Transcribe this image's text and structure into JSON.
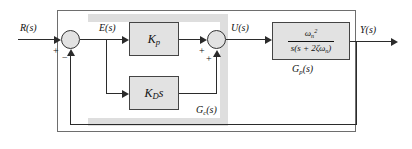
{
  "figure": {
    "frame_color": "#6e6e6e",
    "block_fill": "#e2e2e2",
    "band_color": "#dedede",
    "wire_color": "#2b2b2b"
  },
  "signals": {
    "input": "R(s)",
    "error": "E(s)",
    "control": "U(s)",
    "output": "Y(s)"
  },
  "blocks": {
    "proportional": {
      "label": "K_p",
      "base": "K",
      "sub": "p"
    },
    "derivative": {
      "label": "K_D s",
      "base": "K",
      "sub": "D",
      "trail": "s"
    },
    "plant": {
      "label": "ωn² / (s(s + 2ζωn))",
      "numerator_base": "ω",
      "numerator_sub": "n",
      "numerator_sup": "2",
      "denominator_prefix": "s(s + 2ζω",
      "denominator_sub": "n",
      "denominator_suffix": ")"
    }
  },
  "annotations": {
    "controller": {
      "base": "G",
      "sub": "c",
      "suffix": "(s)",
      "label": "Gc(s)"
    },
    "plant": {
      "base": "G",
      "sub": "p",
      "suffix": "(s)",
      "label": "Gp(s)"
    }
  },
  "summing_junctions": [
    {
      "name": "error-junction",
      "signs": [
        "+",
        "−"
      ]
    },
    {
      "name": "control-junction",
      "signs": [
        "+",
        "+"
      ]
    }
  ]
}
